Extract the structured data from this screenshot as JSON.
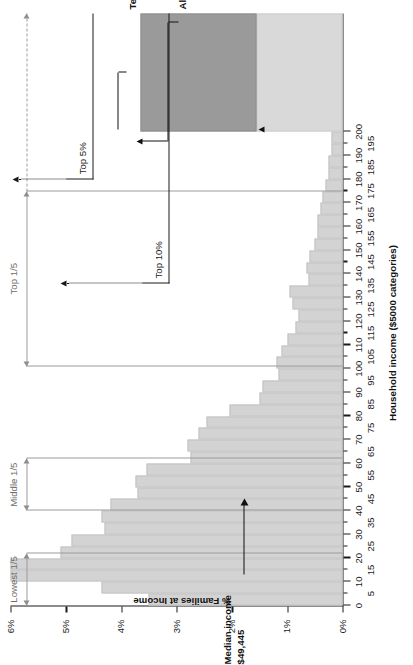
{
  "chart_data": {
    "type": "bar",
    "title": "",
    "xlabel": "Household income ($5000 categories)",
    "ylabel": "% Families at Income",
    "xlim": [
      0,
      250
    ],
    "ylim": [
      0,
      6
    ],
    "grid": false,
    "legend": null,
    "bar_width_thousands": 5,
    "x_tick_labels": [
      "0",
      "5",
      "10",
      "15",
      "20",
      "25",
      "30",
      "35",
      "40",
      "45",
      "50",
      "55",
      "60",
      "65",
      "70",
      "75",
      "80",
      "85",
      "90",
      "95",
      "100",
      "105",
      "110",
      "115",
      "120",
      "125",
      "130",
      "135",
      "140",
      "145",
      "150",
      "155",
      "160",
      "165",
      "170",
      "175",
      "180",
      "185",
      "190",
      "195",
      "200"
    ],
    "y_tick_labels": [
      "0%",
      "1%",
      "2%",
      "3%",
      "4%",
      "5%",
      "6%"
    ],
    "y_tick_values": [
      0,
      1,
      2,
      3,
      4,
      5,
      6
    ],
    "categories": [
      "0-5",
      "5-10",
      "10-15",
      "15-20",
      "20-25",
      "25-30",
      "30-35",
      "35-40",
      "40-45",
      "45-50",
      "50-55",
      "55-60",
      "60-65",
      "65-70",
      "70-75",
      "75-80",
      "80-85",
      "85-90",
      "90-95",
      "95-100",
      "100-105",
      "105-110",
      "110-115",
      "115-120",
      "120-125",
      "125-130",
      "130-135",
      "135-140",
      "140-145",
      "145-150",
      "150-155",
      "155-160",
      "160-165",
      "165-170",
      "170-175",
      "175-180",
      "180-185",
      "185-190",
      "190-195",
      "195-200",
      "200-250",
      "250+"
    ],
    "values": [
      3.5,
      4.35,
      6.0,
      6.0,
      5.1,
      4.9,
      4.3,
      4.35,
      4.2,
      3.7,
      3.75,
      3.55,
      2.75,
      2.8,
      2.6,
      2.45,
      2.05,
      1.5,
      1.45,
      1.15,
      1.2,
      1.1,
      1.0,
      0.85,
      0.8,
      0.9,
      0.95,
      0.62,
      0.65,
      0.6,
      0.5,
      0.45,
      0.45,
      0.4,
      0.37,
      0.3,
      0.25,
      0.25,
      0.2,
      0.2,
      1.55,
      2.1
    ],
    "special_bars": [
      {
        "key": "wide_bar",
        "label": "Ten bars wide: (200, 250)",
        "value": 1.55,
        "style": "wide"
      },
      {
        "key": "overflow_bar",
        "label": "All income ≥ 250",
        "value": 2.1,
        "style": "dark"
      }
    ]
  },
  "axes": {
    "value_axis_title": "% Families at Income",
    "category_axis_title": "Household income ($5000 categories)"
  },
  "quintiles": [
    {
      "key": "lowest",
      "label": "Lowest 1/5",
      "start": 0,
      "end": 22,
      "dashed_to": null
    },
    {
      "key": "middle",
      "label": "Middle 1/5",
      "start": 40,
      "end": 62,
      "dashed_to": null
    },
    {
      "key": "top",
      "label": "Top 1/5",
      "start": 101,
      "end": 175,
      "dashed_to": 250
    }
  ],
  "top_brackets": [
    {
      "key": "top10",
      "label": "Top 10%",
      "from": 136,
      "to": 250
    },
    {
      "key": "top5",
      "label": "Top 5%",
      "from": 180,
      "to": 250
    }
  ],
  "annotations": {
    "median": {
      "line1": "Median income",
      "line2": "$49,445",
      "value": 49.445
    },
    "wide_bar_callout": "Ten bars wide: (200, 250)",
    "overflow_callout": "All income ≥ 250"
  },
  "colors": {
    "bar": "#d3d3d3",
    "bar_wide": "#d9d9d9",
    "bar_dark": "#9a9a9a",
    "axis": "#1a1a1a",
    "quintile": "#9c9c9c",
    "annotation": "#111111",
    "background": "#ffffff"
  }
}
